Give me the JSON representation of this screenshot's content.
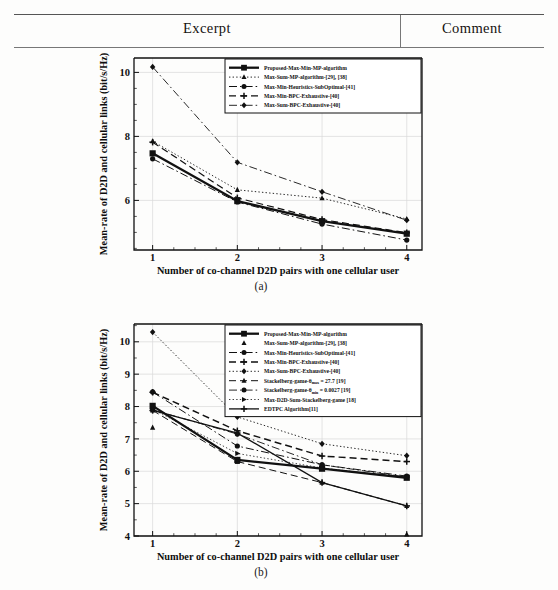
{
  "table": {
    "columns": [
      {
        "label": "Excerpt"
      },
      {
        "label": "Comment"
      }
    ]
  },
  "figures": [
    {
      "id": "a",
      "caption": "(a)"
    },
    {
      "id": "b",
      "caption": "(b)"
    }
  ],
  "chart_data": [
    {
      "type": "line",
      "panel": "(a)",
      "title": "",
      "xlabel": "Number of co-channel D2D pairs with one  cellular user",
      "ylabel": "Mean-rate of D2D and cellular links (bit/s/Hz)",
      "x": [
        1,
        2,
        3,
        4
      ],
      "xticklabels": [
        "1",
        "2",
        "3",
        "4"
      ],
      "xlim": [
        0.78,
        4.18
      ],
      "ylim": [
        4.45,
        10.45
      ],
      "yticks": [
        6,
        8,
        10
      ],
      "yticklabels": [
        "6",
        "8",
        "10"
      ],
      "grid": true,
      "legend_position": "upper-right-inside",
      "series": [
        {
          "name": "Proposed-Max-Min-MP-algorithm",
          "marker": "square",
          "dash": "solid",
          "width": 2.3,
          "values": [
            7.47,
            5.98,
            5.35,
            4.96
          ]
        },
        {
          "name": "Max-Sum-MP-algorithm-[29], [38]",
          "marker": "triangle",
          "dash": "dotted",
          "width": 0.9,
          "values": [
            7.85,
            6.33,
            6.07,
            5.42
          ]
        },
        {
          "name": "Max-Min-Heuristics-SubOptimal-[41]",
          "marker": "circle",
          "dash": "dashdot",
          "width": 1.0,
          "values": [
            7.3,
            5.95,
            5.26,
            4.76
          ]
        },
        {
          "name": "Max-Min-BPC-Exhaustive-[40]",
          "marker": "plus",
          "dash": "dashed",
          "width": 1.2,
          "values": [
            7.82,
            6.08,
            5.4,
            4.99
          ]
        },
        {
          "name": "Max-Sum-BPC-Exhaustive-[40]",
          "marker": "diamond",
          "dash": "dashdot",
          "width": 0.9,
          "values": [
            10.17,
            7.19,
            6.27,
            5.38
          ]
        }
      ]
    },
    {
      "type": "line",
      "panel": "(b)",
      "title": "",
      "xlabel": "Number of co-channel D2D pairs  with one cellular user",
      "ylabel": "Mean-rate of D2D and cellular links (bit/s/Hz)",
      "x": [
        1,
        2,
        3,
        4
      ],
      "xticklabels": [
        "1",
        "2",
        "3",
        "4"
      ],
      "xlim": [
        0.78,
        4.18
      ],
      "ylim": [
        4.0,
        10.55
      ],
      "yticks": [
        4,
        5,
        6,
        7,
        8,
        9,
        10
      ],
      "yticklabels": [
        "4",
        "5",
        "6",
        "7",
        "8",
        "9",
        "10"
      ],
      "grid": true,
      "legend_position": "upper-right-inside",
      "series": [
        {
          "name": "Proposed-Max-Min-MP-algorithm",
          "marker": "square",
          "dash": "solid",
          "width": 2.3,
          "values": [
            8.02,
            6.35,
            6.08,
            5.8
          ]
        },
        {
          "name": "Max-Sum-MP-algorithm-[29], [38]",
          "marker": "triangle",
          "dash": "none",
          "width": 0.0,
          "values": [
            7.35,
            6.3,
            6.15,
            4.05
          ]
        },
        {
          "name": "Max-Min-Heuristics-SubOptimal-[41]",
          "marker": "circle",
          "dash": "dashdot",
          "width": 1.0,
          "values": [
            8.45,
            6.78,
            6.2,
            5.85
          ]
        },
        {
          "name": "Max-Min-BPC-Exhaustive-[40]",
          "marker": "plus",
          "dash": "dashed",
          "width": 1.5,
          "values": [
            8.44,
            7.25,
            6.47,
            6.3
          ]
        },
        {
          "name": "Max-Sum-BPC-Exhaustive-[40]",
          "marker": "diamond",
          "dash": "dotted",
          "width": 0.9,
          "values": [
            10.3,
            7.68,
            6.85,
            6.48
          ]
        },
        {
          "name": "Stackelberg-game-θmax = 27.7 [19]",
          "marker": "triangle",
          "dash": "dashed",
          "width": 1.0,
          "values": [
            7.88,
            6.3,
            5.65,
            4.93
          ]
        },
        {
          "name": "Stackelberg-game-θmin = 0.0027 [19]",
          "marker": "circle",
          "dash": "dashdot",
          "width": 0.9,
          "values": [
            7.9,
            7.15,
            6.2,
            5.82
          ]
        },
        {
          "name": "Max-D2D-Sum-Stackelberg-game [18]",
          "marker": "rtriangle",
          "dash": "dotted",
          "width": 0.8,
          "values": [
            7.92,
            6.55,
            6.1,
            5.8
          ]
        },
        {
          "name": "EDTPC Algorithm[11]",
          "marker": "plus",
          "dash": "solid",
          "width": 1.3,
          "values": [
            7.88,
            7.18,
            5.65,
            4.93
          ]
        }
      ],
      "legend_subscripts": [
        {
          "entry": 5,
          "base": "Stackelberg-game-",
          "sub": "max",
          "rest": " = 27.7 [19]"
        },
        {
          "entry": 6,
          "base": "Stackelberg-game-",
          "sub": "min",
          "rest": " = 0.0027 [19]"
        }
      ]
    }
  ]
}
